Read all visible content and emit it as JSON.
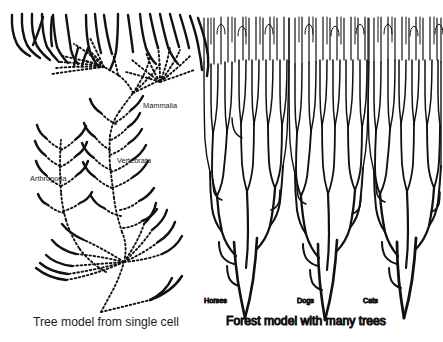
{
  "figure": {
    "title_left": "Tree model from single cell",
    "title_right": "Forest model with many trees",
    "background_color": "#ffffff",
    "ink_color": "#111111"
  },
  "tree_model": {
    "caption": "Tree model from single cell",
    "node_labels": [
      {
        "id": "mammalia",
        "text": "Mammalia",
        "x": 143,
        "y": 105
      },
      {
        "id": "vertebrata",
        "text": "Vertebrata",
        "x": 117,
        "y": 160
      },
      {
        "id": "arthropoda",
        "text": "Arthropoda",
        "x": 30,
        "y": 178
      }
    ],
    "line_style": "dotted",
    "description": "Single dotted phylogenetic tree radiating upward from one root at the bottom, with solid terminal branch tips."
  },
  "forest_model": {
    "caption": "Forest model with many trees",
    "tree_labels": [
      {
        "id": "horses",
        "text": "Horses",
        "x": 204,
        "y": 300
      },
      {
        "id": "dogs",
        "text": "Dogs",
        "x": 297,
        "y": 300
      },
      {
        "id": "cats",
        "text": "Cats",
        "x": 363,
        "y": 300
      }
    ],
    "line_style": "solid",
    "tree_count": 3,
    "description": "Three separate solid-line trees, each with many fine branches fanning upward from an independent root."
  }
}
